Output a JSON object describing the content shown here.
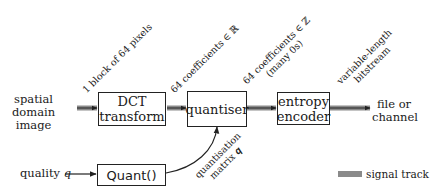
{
  "diagram": {
    "input_label": [
      "spatial",
      "domain",
      "image"
    ],
    "output_label": [
      "file or",
      "channel"
    ],
    "quality_label": "quality",
    "quality_var": "q",
    "blocks": {
      "dct": [
        "DCT",
        "transform"
      ],
      "quantiser": "quantiser",
      "entropy": [
        "entropy",
        "encoder"
      ],
      "quant": "Quant()"
    },
    "edge_labels": {
      "pixels": "1 block of 64 pixels",
      "real_coeffs": "64 coefficients ∈ ℝ",
      "int_coeffs": "64 coefficients ∈ ℤ",
      "int_coeffs_note": "(many 0s)",
      "bitstream_1": "variable-length",
      "bitstream_2": "bitstream",
      "qmatrix_1": "quantisation",
      "qmatrix_2": "matrix 𝒒"
    },
    "legend": {
      "label": "signal track",
      "color": "#8a8a8a"
    },
    "colors": {
      "signal_track": "#8a8a8a",
      "line": "#222222"
    }
  }
}
